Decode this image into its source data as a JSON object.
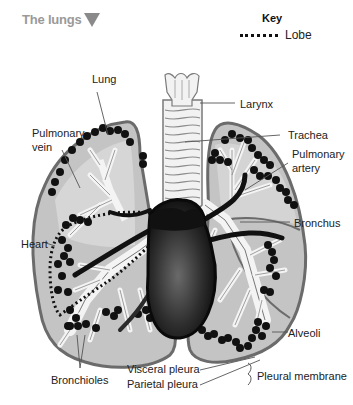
{
  "header": {
    "title": "The lungs",
    "dropdown_icon": "triangle-down-icon"
  },
  "key": {
    "title": "Key",
    "items": [
      {
        "symbol": "dotted-line",
        "label": "Lobe"
      }
    ]
  },
  "labels": {
    "lung": "Lung",
    "pulmonary_vein_1": "Pulmonary",
    "pulmonary_vein_2": "vein",
    "heart": "Heart",
    "bronchioles": "Bronchioles",
    "larynx": "Larynx",
    "trachea": "Trachea",
    "pulmonary_artery_1": "Pulmonary",
    "pulmonary_artery_2": "artery",
    "bronchus": "Bronchus",
    "alveoli": "Alveoli",
    "visceral_pleura": "Visceral pleura",
    "parietal_pleura": "Parietal pleura",
    "pleural_membrane": "Pleural membrane"
  },
  "colors": {
    "lung_fill": "#bdbdbd",
    "lung_outline": "#6e6e6e",
    "airway": "#f4f4f4",
    "heart": "#1a1a1a",
    "alveoli": "#111111",
    "title": "#9a9a9a"
  }
}
